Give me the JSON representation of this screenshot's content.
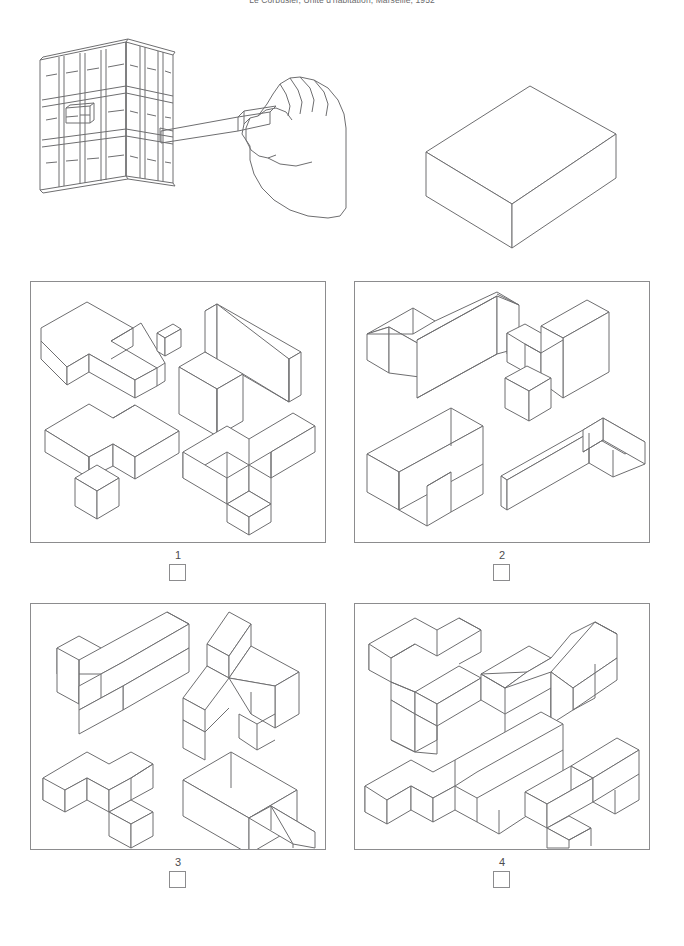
{
  "header": {
    "caption": "Le Corbusier, Unité d'habitation, Marseille, 1952"
  },
  "reference": {
    "hand_drawing_name": "hand-inserting-module-into-facade",
    "solid_drawing_name": "isometric-rectangular-block"
  },
  "options": [
    {
      "id": "1",
      "label": "1",
      "checked": false
    },
    {
      "id": "2",
      "label": "2",
      "checked": false
    },
    {
      "id": "3",
      "label": "3",
      "checked": false
    },
    {
      "id": "4",
      "label": "4",
      "checked": false
    }
  ],
  "colors": {
    "line": "#6e6e70",
    "panel_border": "#8c8c8e",
    "text": "#4d4d4f",
    "background": "#ffffff"
  }
}
